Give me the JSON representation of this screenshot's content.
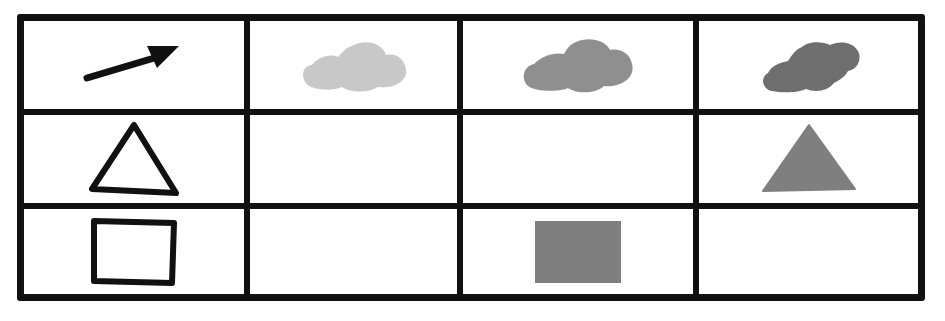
{
  "figure": {
    "rows": 3,
    "cols": 4,
    "colors": {
      "line": "#111111",
      "background": "#ffffff",
      "light_gray": "#c8c8c8",
      "medium_gray": "#8f8f8f",
      "dark_gray": "#6e6e6e",
      "fill_gray": "#7f7f7f"
    },
    "cells": [
      [
        {
          "icon": "arrow-icon",
          "style": "black stroke"
        },
        {
          "icon": "cloud-icon",
          "style": "light gray fill"
        },
        {
          "icon": "cloud-icon",
          "style": "medium gray fill"
        },
        {
          "icon": "cloud-icon",
          "style": "dark gray fill"
        }
      ],
      [
        {
          "icon": "triangle-outline-icon",
          "style": "black outline"
        },
        {
          "icon": null,
          "style": "empty"
        },
        {
          "icon": null,
          "style": "empty"
        },
        {
          "icon": "triangle-filled-icon",
          "style": "gray fill"
        }
      ],
      [
        {
          "icon": "rectangle-outline-icon",
          "style": "black outline"
        },
        {
          "icon": null,
          "style": "empty"
        },
        {
          "icon": "square-filled-icon",
          "style": "gray fill"
        },
        {
          "icon": null,
          "style": "empty"
        }
      ]
    ]
  }
}
